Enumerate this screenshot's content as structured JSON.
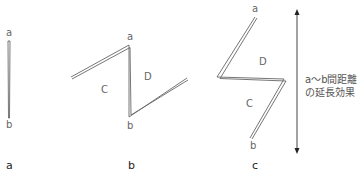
{
  "panels": [
    {
      "id": "a",
      "caption": "a",
      "end_labels": {
        "top": "a",
        "bottom": "b"
      }
    },
    {
      "id": "b",
      "caption": "b",
      "end_labels": {
        "top": "a",
        "bottom": "b"
      },
      "region_labels": {
        "left": "C",
        "right": "D"
      }
    },
    {
      "id": "c",
      "caption": "c",
      "end_labels": {
        "top": "a",
        "bottom": "b"
      },
      "region_labels": {
        "upper": "D",
        "lower": "C"
      }
    }
  ],
  "annotation": {
    "line1": "a～b間距離",
    "line2": "の延長効果"
  },
  "colors": {
    "stroke": "#555555",
    "text": "#666666",
    "caption": "#222222"
  }
}
